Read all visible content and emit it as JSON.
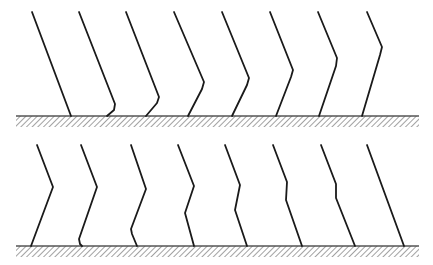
{
  "figure": {
    "stroke_color": "#1a1a1a",
    "ground_color": "#555555",
    "hatch_color": "#7a7a7a",
    "panels": [
      {
        "name": "top-row",
        "ground": {
          "x1": 16,
          "x2": 419,
          "y": 116,
          "hatch_height": 11
        },
        "lines": [
          {
            "points": [
              [
                32,
                12
              ],
              [
                71,
                116
              ]
            ]
          },
          {
            "points": [
              [
                79,
                12
              ],
              [
                115,
                104
              ],
              [
                114,
                110
              ],
              [
                107,
                116
              ]
            ]
          },
          {
            "points": [
              [
                126,
                12
              ],
              [
                159,
                97
              ],
              [
                157,
                103
              ],
              [
                146,
                116
              ]
            ]
          },
          {
            "points": [
              [
                174,
                12
              ],
              [
                204,
                82
              ],
              [
                202,
                89
              ],
              [
                188,
                116
              ]
            ]
          },
          {
            "points": [
              [
                222,
                12
              ],
              [
                249,
                78
              ],
              [
                247,
                85
              ],
              [
                232,
                116
              ]
            ]
          },
          {
            "points": [
              [
                270,
                12
              ],
              [
                293,
                70
              ],
              [
                291,
                77
              ],
              [
                276,
                116
              ]
            ]
          },
          {
            "points": [
              [
                318,
                12
              ],
              [
                337,
                58
              ],
              [
                336,
                66
              ],
              [
                319,
                116
              ]
            ]
          },
          {
            "points": [
              [
                367,
                12
              ],
              [
                382,
                47
              ],
              [
                380,
                55
              ],
              [
                362,
                116
              ]
            ]
          }
        ]
      },
      {
        "name": "bottom-row",
        "ground": {
          "x1": 16,
          "x2": 419,
          "y": 246,
          "hatch_height": 11
        },
        "lines": [
          {
            "points": [
              [
                37,
                145
              ],
              [
                53,
                187
              ],
              [
                31,
                246
              ]
            ]
          },
          {
            "points": [
              [
                81,
                145
              ],
              [
                97,
                187
              ],
              [
                79,
                239
              ],
              [
                80,
                244
              ],
              [
                82,
                246
              ]
            ]
          },
          {
            "points": [
              [
                131,
                145
              ],
              [
                146,
                189
              ],
              [
                131,
                229
              ],
              [
                132,
                234
              ],
              [
                137,
                246
              ]
            ]
          },
          {
            "points": [
              [
                178,
                145
              ],
              [
                194,
                186
              ],
              [
                185,
                213
              ],
              [
                194,
                246
              ]
            ]
          },
          {
            "points": [
              [
                225,
                145
              ],
              [
                240,
                185
              ],
              [
                235,
                210
              ],
              [
                247,
                246
              ]
            ]
          },
          {
            "points": [
              [
                273,
                145
              ],
              [
                287,
                182
              ],
              [
                286,
                200
              ],
              [
                302,
                246
              ]
            ]
          },
          {
            "points": [
              [
                321,
                145
              ],
              [
                336,
                184
              ],
              [
                336,
                198
              ],
              [
                355,
                246
              ]
            ]
          },
          {
            "points": [
              [
                367,
                145
              ],
              [
                404,
                246
              ]
            ]
          }
        ]
      }
    ]
  }
}
